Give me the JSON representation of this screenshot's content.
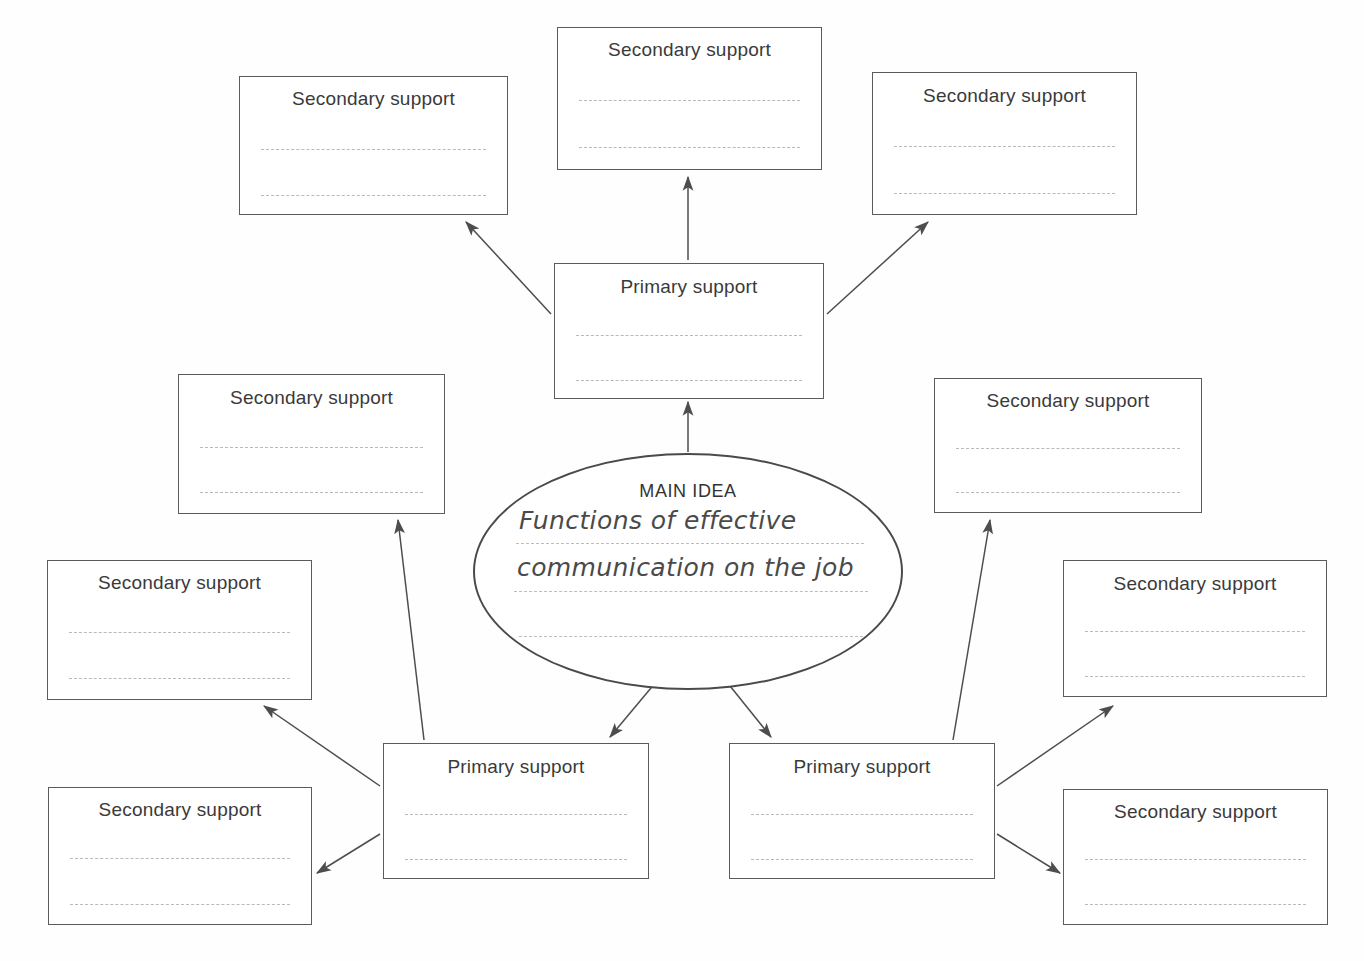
{
  "diagram": {
    "type": "idea-web graphic organizer",
    "center": {
      "label": "MAIN IDEA",
      "handwritten_lines": [
        "Functions of effective",
        "communication on the job"
      ],
      "blank_rule_count": 1
    },
    "primary_label": "Primary support",
    "secondary_label": "Secondary support",
    "colors": {
      "box_border": "#5b5b5b",
      "ellipse_border": "#4a4a4a",
      "rule_line": "#b9b9b9",
      "text": "#3a3a3a",
      "arrow": "#4d4d4d",
      "background": "#ffffff"
    },
    "nodes": [
      {
        "id": "primary-top",
        "role": "primary",
        "label": "Primary support",
        "x": 554,
        "y": 263,
        "w": 270,
        "h": 136
      },
      {
        "id": "primary-bottom-left",
        "role": "primary",
        "label": "Primary support",
        "x": 383,
        "y": 743,
        "w": 266,
        "h": 136
      },
      {
        "id": "primary-bottom-right",
        "role": "primary",
        "label": "Primary support",
        "x": 729,
        "y": 743,
        "w": 266,
        "h": 136
      },
      {
        "id": "secondary-top-left",
        "role": "secondary",
        "label": "Secondary support",
        "x": 239,
        "y": 76,
        "w": 269,
        "h": 139
      },
      {
        "id": "secondary-top-center",
        "role": "secondary",
        "label": "Secondary support",
        "x": 557,
        "y": 27,
        "w": 265,
        "h": 143
      },
      {
        "id": "secondary-top-right",
        "role": "secondary",
        "label": "Secondary support",
        "x": 872,
        "y": 72,
        "w": 265,
        "h": 143
      },
      {
        "id": "secondary-mid-left",
        "role": "secondary",
        "label": "Secondary support",
        "x": 178,
        "y": 374,
        "w": 267,
        "h": 140
      },
      {
        "id": "secondary-mid-right",
        "role": "secondary",
        "label": "Secondary support",
        "x": 934,
        "y": 378,
        "w": 268,
        "h": 135
      },
      {
        "id": "secondary-low-left",
        "role": "secondary",
        "label": "Secondary support",
        "x": 47,
        "y": 560,
        "w": 265,
        "h": 140
      },
      {
        "id": "secondary-low-right",
        "role": "secondary",
        "label": "Secondary support",
        "x": 1063,
        "y": 560,
        "w": 264,
        "h": 137
      },
      {
        "id": "secondary-bottom-left",
        "role": "secondary",
        "label": "Secondary support",
        "x": 48,
        "y": 787,
        "w": 264,
        "h": 138
      },
      {
        "id": "secondary-bottom-right",
        "role": "secondary",
        "label": "Secondary support",
        "x": 1063,
        "y": 789,
        "w": 265,
        "h": 136
      }
    ],
    "connections": [
      {
        "from": "main-idea",
        "to": "primary-top"
      },
      {
        "from": "main-idea",
        "to": "primary-bottom-left"
      },
      {
        "from": "main-idea",
        "to": "primary-bottom-right"
      },
      {
        "from": "primary-top",
        "to": "secondary-top-left"
      },
      {
        "from": "primary-top",
        "to": "secondary-top-center"
      },
      {
        "from": "primary-top",
        "to": "secondary-top-right"
      },
      {
        "from": "primary-bottom-left",
        "to": "secondary-mid-left"
      },
      {
        "from": "primary-bottom-left",
        "to": "secondary-low-left"
      },
      {
        "from": "primary-bottom-left",
        "to": "secondary-bottom-left"
      },
      {
        "from": "primary-bottom-right",
        "to": "secondary-mid-right"
      },
      {
        "from": "primary-bottom-right",
        "to": "secondary-low-right"
      },
      {
        "from": "primary-bottom-right",
        "to": "secondary-bottom-right"
      }
    ]
  }
}
